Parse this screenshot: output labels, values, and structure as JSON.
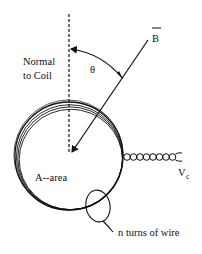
{
  "diagram": {
    "type": "physics-coil-magnetic-field",
    "labels": {
      "b_vector": "B",
      "theta": "θ",
      "normal_line1": "Normal",
      "normal_line2": "to Coil",
      "area": "A--area",
      "voltage_main": "V",
      "voltage_sub": "c",
      "turns": "n turns of wire"
    },
    "colors": {
      "ink": "#111111",
      "background": "#ffffff"
    }
  }
}
